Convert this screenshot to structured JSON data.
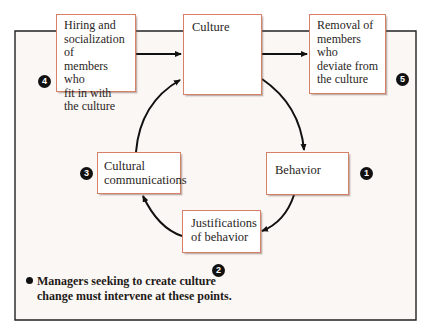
{
  "diagram": {
    "boxes": {
      "hiring": {
        "label": "Hiring and\nsocialization of\nmembers who\nfit in with\nthe culture"
      },
      "culture": {
        "label": "Culture"
      },
      "removal": {
        "label": "Removal of\nmembers who\ndeviate from\nthe culture"
      },
      "behavior": {
        "label": "Behavior"
      },
      "justifications": {
        "label": "Justifications\nof behavior"
      },
      "communications": {
        "label": "Cultural\ncommunications"
      }
    },
    "badges": {
      "b1": "1",
      "b2": "2",
      "b3": "3",
      "b4": "4",
      "b5": "5"
    },
    "note": {
      "line1": "Managers seeking to create culture",
      "line2": "change must intervene at these points."
    },
    "colors": {
      "box_border": "#d6806a",
      "frame_bg": "#fbf7f4",
      "line": "#111111"
    }
  }
}
